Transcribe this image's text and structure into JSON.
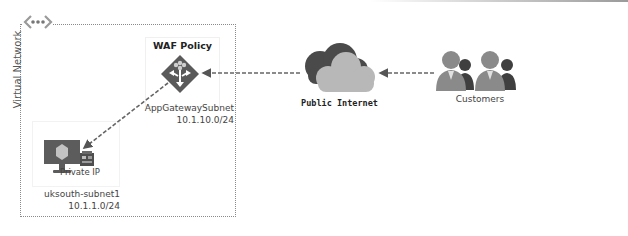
{
  "diagram": {
    "vnet": {
      "label": "Virtual Network",
      "icon": "virtual-network-icon"
    },
    "waf": {
      "title": "WAF Policy",
      "icon": "application-gateway-icon",
      "subnet_name": "AppGatewaySubnet",
      "subnet_cidr": "10.1.10.0/24"
    },
    "vm_subnet": {
      "vm_icon": "virtual-machine-icon",
      "nic_icon": "network-interface-icon",
      "nic_label": "Private IP",
      "subnet_name": "uksouth-subnet1",
      "subnet_cidr": "10.1.1.0/24"
    },
    "internet": {
      "label": "Public Internet",
      "icon": "cloud-icon"
    },
    "customers": {
      "label": "Customers",
      "icon": "users-icon"
    },
    "connections": [
      {
        "from": "Customers",
        "to": "Public Internet",
        "style": "dashed-arrow"
      },
      {
        "from": "Public Internet",
        "to": "WAF Policy",
        "style": "dashed-arrow"
      },
      {
        "from": "WAF Policy",
        "to": "Private IP",
        "style": "dashed-arrow"
      }
    ],
    "colors": {
      "line": "#6b6b6b",
      "cloud_dark": "#4a4a4a",
      "cloud_light": "#b8b8b8",
      "diamond": "#5a5a5a"
    }
  }
}
